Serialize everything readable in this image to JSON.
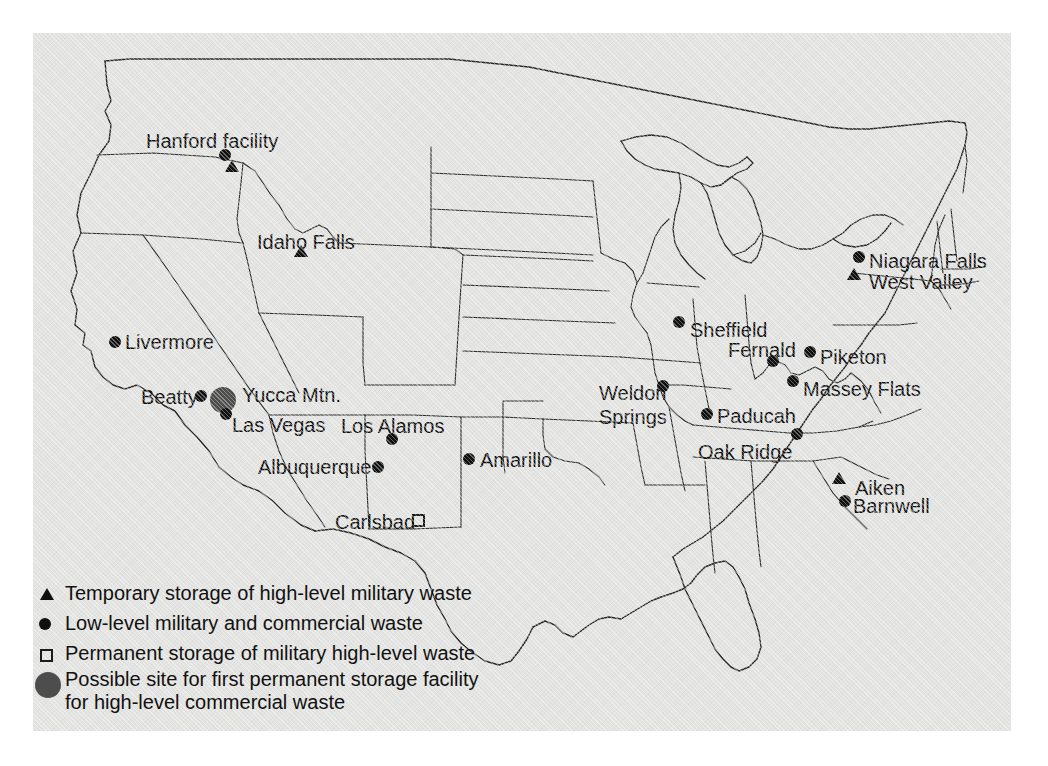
{
  "map": {
    "title": "Nuclear waste storage sites in the United States",
    "background_color": "#e3e3e1",
    "outline_color": "#2a2a2a",
    "marker_color": "#101010",
    "highlight_color": "#4d4d4d",
    "page_background": "#ffffff"
  },
  "sites": [
    {
      "id": "hanford",
      "label": "Hanford facility",
      "symbols": [
        "dot",
        "triangle"
      ],
      "label_x": 113,
      "label_y": 97,
      "dot_x": 192,
      "dot_y": 122,
      "tri_x": 199,
      "tri_y": 133
    },
    {
      "id": "idaho-falls",
      "label": "Idaho Falls",
      "symbols": [
        "triangle"
      ],
      "label_x": 224,
      "label_y": 198,
      "tri_x": 268,
      "tri_y": 218
    },
    {
      "id": "livermore",
      "label": "Livermore",
      "symbols": [
        "dot"
      ],
      "label_x": 92,
      "label_y": 298,
      "dot_x": 82,
      "dot_y": 309
    },
    {
      "id": "beatty",
      "label": "Beatty",
      "symbols": [
        "dot"
      ],
      "label_x": 108,
      "label_y": 353,
      "dot_x": 168,
      "dot_y": 363
    },
    {
      "id": "yucca-mtn",
      "label": "Yucca Mtn.",
      "symbols": [
        "bigdot"
      ],
      "label_x": 209,
      "label_y": 351,
      "dot_x": 190,
      "dot_y": 367
    },
    {
      "id": "las-vegas",
      "label": "Las Vegas",
      "symbols": [
        "dot"
      ],
      "label_x": 199,
      "label_y": 381,
      "dot_x": 193,
      "dot_y": 381
    },
    {
      "id": "los-alamos",
      "label": "Los Alamos",
      "symbols": [
        "dot"
      ],
      "label_x": 308,
      "label_y": 382,
      "dot_x": 359,
      "dot_y": 406
    },
    {
      "id": "albuquerque",
      "label": "Albuquerque",
      "symbols": [
        "dot"
      ],
      "label_x": 225,
      "label_y": 423,
      "dot_x": 345,
      "dot_y": 434
    },
    {
      "id": "amarillo",
      "label": "Amarillo",
      "symbols": [
        "dot"
      ],
      "label_x": 447,
      "label_y": 416,
      "dot_x": 436,
      "dot_y": 426
    },
    {
      "id": "carlsbad",
      "label": "Carlsbad",
      "symbols": [
        "square"
      ],
      "label_x": 302,
      "label_y": 478,
      "sq_x": 385,
      "sq_y": 487
    },
    {
      "id": "weldon-springs",
      "label": "Weldon Springs",
      "symbols": [
        "dot"
      ],
      "label_x": 566,
      "label_y": 348,
      "dot_x": 630,
      "dot_y": 353,
      "two_line": true,
      "label_w": 72
    },
    {
      "id": "sheffield",
      "label": "Sheffield",
      "symbols": [
        "dot"
      ],
      "label_x": 657,
      "label_y": 286,
      "dot_x": 646,
      "dot_y": 289
    },
    {
      "id": "fernald",
      "label": "Fernald",
      "symbols": [
        "dot"
      ],
      "label_x": 695,
      "label_y": 306,
      "dot_x": 740,
      "dot_y": 328
    },
    {
      "id": "piketon",
      "label": "Piketon",
      "symbols": [
        "dot"
      ],
      "label_x": 787,
      "label_y": 313,
      "dot_x": 777,
      "dot_y": 319
    },
    {
      "id": "massey-flats",
      "label": "Massey Flats",
      "symbols": [
        "dot"
      ],
      "label_x": 770,
      "label_y": 345,
      "dot_x": 760,
      "dot_y": 348
    },
    {
      "id": "paducah",
      "label": "Paducah",
      "symbols": [
        "dot"
      ],
      "label_x": 684,
      "label_y": 372,
      "dot_x": 674,
      "dot_y": 381
    },
    {
      "id": "oak-ridge",
      "label": "Oak Ridge",
      "symbols": [
        "dot"
      ],
      "label_x": 665,
      "label_y": 408,
      "dot_x": 764,
      "dot_y": 401
    },
    {
      "id": "niagara-falls",
      "label": "Niagara Falls",
      "symbols": [
        "dot"
      ],
      "label_x": 836,
      "label_y": 217,
      "dot_x": 826,
      "dot_y": 224
    },
    {
      "id": "west-valley",
      "label": "West Valley",
      "symbols": [
        "triangle"
      ],
      "label_x": 836,
      "label_y": 238,
      "tri_x": 821,
      "tri_y": 241
    },
    {
      "id": "aiken",
      "label": "Aiken",
      "symbols": [
        "triangle"
      ],
      "label_x": 822,
      "label_y": 444,
      "tri_x": 806,
      "tri_y": 445
    },
    {
      "id": "barnwell",
      "label": "Barnwell",
      "symbols": [
        "dot"
      ],
      "label_x": 820,
      "label_y": 462,
      "dot_x": 812,
      "dot_y": 468
    }
  ],
  "legend": {
    "items": [
      {
        "symbol": "triangle",
        "text": "Temporary storage of high-level military waste"
      },
      {
        "symbol": "dot",
        "text": "Low-level military and commercial waste"
      },
      {
        "symbol": "square",
        "text": "Permanent storage of military high-level waste"
      },
      {
        "symbol": "bigdot",
        "text": "Possible site for first permanent storage facility for high-level commercial waste"
      }
    ]
  }
}
